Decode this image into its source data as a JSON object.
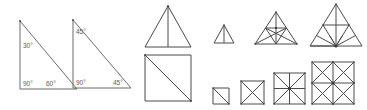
{
  "page": {
    "background_color": "#ffffff",
    "stroke_color": "#6b6b6b",
    "label_color": "#5a5a5a",
    "width": 367,
    "height": 110
  },
  "figures": {
    "triangle_30_60_90": {
      "name": "30-60-90 right triangle",
      "labels": {
        "top_angle": "30°",
        "bottom_left_angle": "90°",
        "bottom_right_angle": "60°"
      }
    },
    "triangle_45_45_90": {
      "name": "45-45-90 right triangle",
      "labels": {
        "top_angle": "45°",
        "bottom_left_angle": "90°",
        "bottom_right_angle": "45°"
      }
    },
    "triangle_with_median": {
      "name": "Isosceles triangle divided by a vertical median into 2 triangles",
      "parts": "2"
    },
    "square_with_diagonal": {
      "name": "Square divided by one diagonal into 2 triangles",
      "parts": "2"
    },
    "triangle_series": [
      {
        "name": "Small triangle with vertical median",
        "parts": "2"
      },
      {
        "name": "Medium triangle with medians and midsegment fan",
        "parts": "6"
      },
      {
        "name": "Large triangle with midsegments and fan from base midpoint",
        "parts": "8"
      }
    ],
    "square_series": [
      {
        "name": "Small square with one diagonal",
        "parts": "2"
      },
      {
        "name": "Square with both diagonals",
        "parts": "4"
      },
      {
        "name": "Square with both diagonals and midlines",
        "parts": "8"
      },
      {
        "name": "Square as 2 by 2 grid with diagonals in each cell",
        "parts": "16"
      }
    ]
  }
}
